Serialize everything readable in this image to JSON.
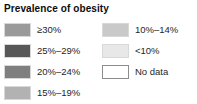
{
  "legend": {
    "title": "Prevalence of obesity",
    "columns": {
      "left": [
        {
          "label": "≥30%",
          "color": "#9a9a9a",
          "bordered": false
        },
        {
          "label": "25%–29%",
          "color": "#585858",
          "bordered": false
        },
        {
          "label": "20%–24%",
          "color": "#7f7f7f",
          "bordered": false
        },
        {
          "label": "15%–19%",
          "color": "#b2b2b2",
          "bordered": false
        }
      ],
      "right": [
        {
          "label": "10%–14%",
          "color": "#c9c9c9",
          "bordered": false
        },
        {
          "label": "<10%",
          "color": "#e8e8e8",
          "bordered": false
        },
        {
          "label": "No data",
          "color": "#ffffff",
          "bordered": true
        }
      ]
    }
  }
}
